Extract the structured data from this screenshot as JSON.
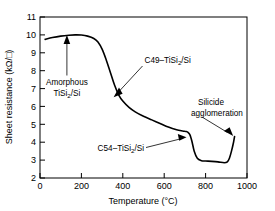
{
  "chart_data": {
    "type": "line",
    "title": "",
    "xlabel": "Temperature (°C)",
    "ylabel": "Sheet resistance (kΩ/□)",
    "xlim": [
      0,
      1000
    ],
    "ylim": [
      2,
      11
    ],
    "xticks": [
      0,
      200,
      400,
      600,
      800,
      1000
    ],
    "xtick_labels": [
      "0",
      "200",
      "400",
      "600",
      "800",
      "1000"
    ],
    "yticks": [
      2,
      3,
      4,
      5,
      6,
      7,
      8,
      9,
      10,
      11
    ],
    "ytick_labels": [
      "2",
      "3",
      "4",
      "5",
      "6",
      "7",
      "8",
      "9",
      "10",
      "11"
    ],
    "grid": false,
    "legend": false,
    "series": [
      {
        "name": "Sheet resistance vs temperature",
        "x": [
          25,
          60,
          100,
          140,
          170,
          200,
          230,
          260,
          280,
          300,
          320,
          340,
          360,
          380,
          400,
          430,
          460,
          500,
          540,
          580,
          620,
          660,
          690,
          705,
          715,
          725,
          735,
          745,
          760,
          780,
          800,
          830,
          860,
          890,
          905,
          915,
          925,
          935,
          940
        ],
        "y": [
          9.75,
          9.85,
          9.93,
          9.98,
          10.0,
          9.99,
          9.93,
          9.8,
          9.6,
          9.2,
          8.6,
          7.9,
          7.2,
          6.65,
          6.3,
          5.95,
          5.7,
          5.45,
          5.25,
          5.05,
          4.85,
          4.7,
          4.63,
          4.6,
          4.55,
          4.4,
          4.0,
          3.5,
          3.1,
          2.97,
          2.95,
          2.93,
          2.9,
          2.85,
          2.9,
          3.1,
          3.5,
          4.0,
          4.32
        ]
      }
    ],
    "annotations": [
      {
        "id": "amorphous",
        "line1": "Amorphous",
        "line2_pre": "TiSi",
        "line2_sub": "2",
        "line2_post": "/Si",
        "target": {
          "x": 130,
          "y": 9.55
        }
      },
      {
        "id": "c49",
        "line1_pre": "C49–TiSi",
        "line1_sub": "2",
        "line1_post": "/Si",
        "target": {
          "x": 398,
          "y": 6.55
        }
      },
      {
        "id": "c54",
        "line1_pre": "C54–TiSi",
        "line1_sub": "2",
        "line1_post": "/Si",
        "target": {
          "x": 712,
          "y": 4.0
        }
      },
      {
        "id": "agglomeration",
        "line1": "Silicide",
        "line2": "agglomeration",
        "target": {
          "x": 920,
          "y": 4.05
        }
      }
    ]
  }
}
